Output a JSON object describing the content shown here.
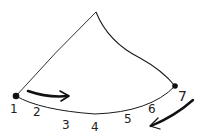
{
  "diagram": {
    "type": "hand-drawn cone / sector sketch",
    "stroke_color": "#1a1a1a",
    "apex": {
      "x": 96,
      "y": 12
    },
    "left_endpoint": {
      "x": 16,
      "y": 96
    },
    "right_endpoint": {
      "x": 175,
      "y": 86
    },
    "labels": [
      {
        "text": "1",
        "x": 10,
        "y": 113
      },
      {
        "text": "2",
        "x": 33,
        "y": 116
      },
      {
        "text": "3",
        "x": 62,
        "y": 129
      },
      {
        "text": "4",
        "x": 91,
        "y": 131
      },
      {
        "text": "5",
        "x": 124,
        "y": 123
      },
      {
        "text": "6",
        "x": 148,
        "y": 113
      },
      {
        "text": "7",
        "x": 178,
        "y": 101
      }
    ],
    "arrows": [
      {
        "name": "top-arrow",
        "direction": "right"
      },
      {
        "name": "bottom-right-arrow",
        "direction": "down-left"
      }
    ]
  }
}
